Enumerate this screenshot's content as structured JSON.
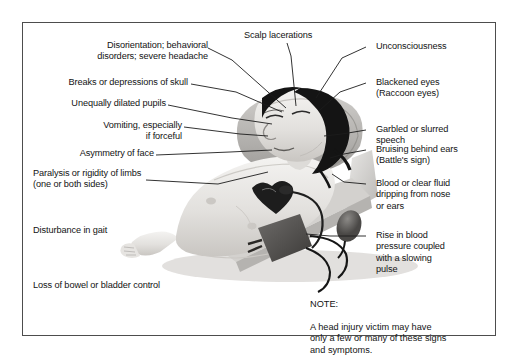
{
  "figure": {
    "frame_color": "#4d4d4d",
    "background_color": "#ffffff",
    "text_color": "#131313"
  },
  "labels_left": [
    {
      "id": "disorientation",
      "text": "Disorientation; behavioral\ndisorders; severe headache"
    },
    {
      "id": "skull-breaks",
      "text": "Breaks or depressions of skull"
    },
    {
      "id": "pupils",
      "text": "Unequally dilated pupils"
    },
    {
      "id": "vomiting",
      "text": "Vomiting, especially\nif forceful"
    },
    {
      "id": "asymmetry",
      "text": "Asymmetry of face"
    },
    {
      "id": "paralysis",
      "text": "Paralysis or rigidity of limbs\n(one or both sides)"
    },
    {
      "id": "gait",
      "text": "Disturbance in gait"
    },
    {
      "id": "bowel",
      "text": "Loss of bowel or bladder control"
    }
  ],
  "labels_top": [
    {
      "id": "scalp",
      "text": "Scalp lacerations"
    }
  ],
  "labels_right": [
    {
      "id": "unconsciousness",
      "text": "Unconsciousness"
    },
    {
      "id": "blackened-eyes",
      "text": "Blackened eyes\n(Raccoon eyes)"
    },
    {
      "id": "speech",
      "text": "Garbled or slurred\nspeech"
    },
    {
      "id": "battles-sign",
      "text": "Bruising behind ears\n(Battle's sign)"
    },
    {
      "id": "csf-leak",
      "text": "Blood or clear fluid\ndripping from nose\nor ears"
    },
    {
      "id": "blood-pressure",
      "text": "Rise in blood\npressure coupled\nwith a slowing\npulse"
    }
  ],
  "note": {
    "heading": "NOTE:",
    "body": "A head injury victim may have\nonly a few or many of these signs\nand symptoms."
  },
  "illustration": {
    "name": "supine-head-injury-patient",
    "elements": [
      "pillow",
      "gurney-surface",
      "patient-head",
      "dark-hair",
      "face",
      "bare-chest",
      "left-arm",
      "blood-pressure-cuff",
      "cuff-tubing",
      "inflation-bulb",
      "stethoscope-head"
    ]
  }
}
